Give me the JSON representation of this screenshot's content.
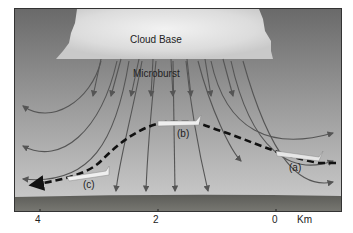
{
  "diagram": {
    "labels": {
      "cloud_base": "Cloud Base",
      "microburst": "Microburst",
      "position_a": "(a)",
      "position_b": "(b)",
      "position_c": "(c)"
    },
    "axis": {
      "ticks": [
        "4",
        "2",
        "0"
      ],
      "unit": "Km"
    },
    "colors": {
      "sky_top": "#6e6e6e",
      "sky_bottom": "#c4c4c4",
      "cloud": "#e8e8e8",
      "ground": "#6a6a64",
      "arrows": "#555555",
      "flight_path": "#111111"
    }
  }
}
